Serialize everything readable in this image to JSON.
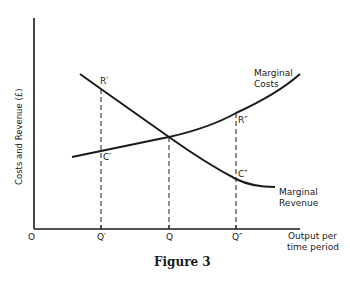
{
  "diagram": {
    "caption": "Figure 3",
    "y_axis_label": "Costs and Revenue (£)",
    "x_axis_label_line1": "Output per",
    "x_axis_label_line2": "time period",
    "origin_label": "O",
    "x_ticks": [
      {
        "label": "Q′",
        "x": 101
      },
      {
        "label": "Q",
        "x": 169
      },
      {
        "label": "Q″",
        "x": 236
      }
    ],
    "curves": {
      "marginal_costs": {
        "label_line1": "Marginal",
        "label_line2": "Costs"
      },
      "marginal_revenue": {
        "label_line1": "Marginal",
        "label_line2": "Revenue"
      }
    },
    "points": {
      "r_prime": "R′",
      "c_prime": "C′",
      "r_double_prime": "R″",
      "c_double_prime": "C″"
    },
    "colors": {
      "ink": "#1a1a1a",
      "background": "#ffffff"
    }
  }
}
